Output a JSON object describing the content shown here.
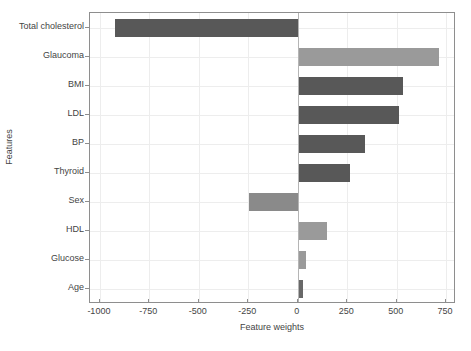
{
  "chart_data": {
    "type": "bar",
    "orientation": "horizontal",
    "title": "",
    "xlabel": "Feature weights",
    "ylabel": "Features",
    "categories": [
      "Total cholesterol",
      "Glaucoma",
      "BMI",
      "LDL",
      "BP",
      "Thyroid",
      "Sex",
      "HDL",
      "Glucose",
      "Age"
    ],
    "values": [
      -925,
      715,
      530,
      510,
      340,
      265,
      -245,
      150,
      40,
      25
    ],
    "bar_colors": [
      "#585858",
      "#9a9a9a",
      "#585858",
      "#585858",
      "#585858",
      "#585858",
      "#8a8a8a",
      "#9a9a9a",
      "#9a9a9a",
      "#686868"
    ],
    "xlim": [
      -1050,
      800
    ],
    "xticks": [
      -1000,
      -750,
      -500,
      -250,
      0,
      250,
      500,
      750
    ],
    "xtick_labels": [
      "-1000",
      "-750",
      "-500",
      "-250",
      "0",
      "250",
      "500",
      "750"
    ],
    "grid": true,
    "legend": null
  },
  "colors": {
    "dark_bar": "#585858",
    "light_bar": "#9a9a9a",
    "grid": "#ededed",
    "axis": "#8e8e8e",
    "zero_line": "#b5b5b5",
    "text": "#444444",
    "background": "#ffffff"
  }
}
